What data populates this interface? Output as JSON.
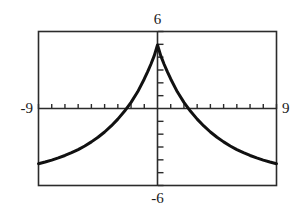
{
  "chart_data": {
    "type": "line",
    "title": "",
    "subtitle": "",
    "xlabel": "",
    "ylabel": "",
    "xlim": [
      -9,
      9
    ],
    "ylim": [
      -6,
      6
    ],
    "grid": false,
    "legend": null,
    "axis_style": "calculator-window",
    "tick_labels": {
      "xmin": "-9",
      "xmax": "9",
      "ymax": "6",
      "ymin": "-6"
    },
    "x_tick_interval": 1,
    "y_tick_interval": 1,
    "series": [
      {
        "name": "bell curve",
        "color": "#111111",
        "line_width": 3,
        "x": [
          -9,
          -8.5,
          -8,
          -7.5,
          -7,
          -6.5,
          -6,
          -5.5,
          -5,
          -4.5,
          -4,
          -3.5,
          -3,
          -2.5,
          -2,
          -1.5,
          -1,
          -0.75,
          -0.5,
          -0.25,
          0,
          0.25,
          0.5,
          0.75,
          1,
          1.5,
          2,
          2.5,
          3,
          3.5,
          4,
          4.5,
          5,
          5.5,
          6,
          6.5,
          7,
          7.5,
          8,
          8.5,
          9
        ],
        "y": [
          -4.3,
          -4.17,
          -4.02,
          -3.85,
          -3.66,
          -3.44,
          -3.2,
          -2.92,
          -2.6,
          -2.24,
          -1.83,
          -1.36,
          -0.83,
          -0.22,
          0.48,
          1.3,
          2.3,
          2.85,
          3.45,
          4.1,
          4.95,
          4.1,
          3.45,
          2.85,
          2.3,
          1.3,
          0.48,
          -0.22,
          -0.83,
          -1.36,
          -1.83,
          -2.24,
          -2.6,
          -2.92,
          -3.2,
          -3.44,
          -3.66,
          -3.85,
          -4.02,
          -4.17,
          -4.3
        ]
      }
    ],
    "annotations": []
  },
  "labels": {
    "top": "6",
    "left": "-9",
    "right": "9",
    "bottom": "-6"
  },
  "colors": {
    "curve": "#111111",
    "frame": "#2b2b2b",
    "axis": "#2b2b2b",
    "background": "#ffffff",
    "text": "#1a1a1a"
  }
}
